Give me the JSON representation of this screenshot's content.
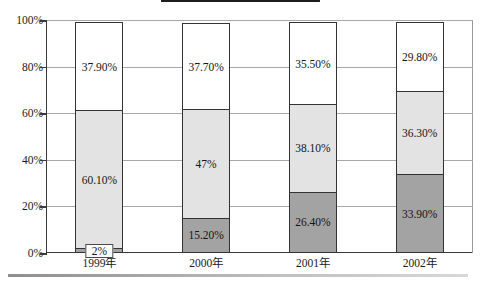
{
  "title_box": {
    "text": ""
  },
  "chart_data": {
    "type": "bar",
    "subtype": "stacked-100-percent",
    "title": "",
    "xlabel": "",
    "ylabel": "",
    "categories": [
      "1999年",
      "2000年",
      "2001年",
      "2002年"
    ],
    "ylim": [
      0,
      100
    ],
    "ytick_labels": [
      "0%",
      "20%",
      "40%",
      "60%",
      "80%",
      "100%"
    ],
    "ytick_values": [
      0,
      20,
      40,
      60,
      80,
      100
    ],
    "grid": true,
    "legend": "none",
    "series": [
      {
        "name": "dark-gray-segment",
        "color": "#a3a3a3",
        "values": [
          2,
          15.2,
          26.4,
          33.9
        ],
        "labels": [
          "2%",
          "15.20%",
          "26.40%",
          "33.90%"
        ]
      },
      {
        "name": "light-gray-segment",
        "color": "#e3e3e3",
        "values": [
          60.1,
          47,
          38.1,
          36.3
        ],
        "labels": [
          "60.10%",
          "47%",
          "38.10%",
          "36.30%"
        ]
      },
      {
        "name": "white-segment",
        "color": "#ffffff",
        "values": [
          37.9,
          37.7,
          35.5,
          29.8
        ],
        "labels": [
          "37.90%",
          "37.70%",
          "35.50%",
          "29.80%"
        ]
      }
    ]
  },
  "colors": {
    "dark": "#a3a3a3",
    "light": "#e3e3e3",
    "white": "#ffffff",
    "axis": "#3a3a3a",
    "grid": "#a8a8a8"
  }
}
